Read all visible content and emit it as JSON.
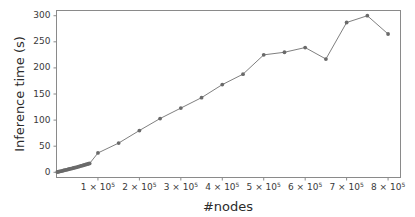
{
  "chart_data": {
    "type": "line",
    "title": "",
    "xlabel": "#nodes",
    "ylabel": "Inference time (s)",
    "xlim": [
      0,
      830000
    ],
    "ylim": [
      -10,
      310
    ],
    "grid": false,
    "legend": null,
    "marker": "circle",
    "line_color": "#707070",
    "marker_color": "#6a6a6a",
    "x_tick_values": [
      100000,
      200000,
      300000,
      400000,
      500000,
      600000,
      700000,
      800000
    ],
    "x_tick_labels": [
      "1 × 10⁵",
      "2 × 10⁵",
      "3 × 10⁵",
      "4 × 10⁵",
      "5 × 10⁵",
      "6 × 10⁵",
      "7 × 10⁵",
      "8 × 10⁵"
    ],
    "x_tick_mantissas": [
      "1",
      "2",
      "3",
      "4",
      "5",
      "6",
      "7",
      "8"
    ],
    "x_tick_exponent": "5",
    "x_tick_base": "10",
    "x_tick_times": "×",
    "y_tick_values": [
      0,
      50,
      100,
      150,
      200,
      250,
      300
    ],
    "y_tick_labels": [
      "0",
      "50",
      "100",
      "150",
      "200",
      "250",
      "300"
    ],
    "series": [
      {
        "name": "inference time",
        "x": [
          2000,
          5000,
          8000,
          11000,
          14000,
          17000,
          20000,
          23000,
          26000,
          29000,
          32000,
          35000,
          38000,
          41000,
          44000,
          47000,
          50000,
          53000,
          56000,
          59000,
          62000,
          65000,
          68000,
          71000,
          74000,
          77000,
          80000,
          100000,
          150000,
          200000,
          250000,
          300000,
          350000,
          400000,
          450000,
          500000,
          550000,
          600000,
          650000,
          700000,
          750000,
          800000
        ],
        "y": [
          0.5,
          1.0,
          1.6,
          2.2,
          2.8,
          3.4,
          4.0,
          4.6,
          5.2,
          5.8,
          6.4,
          7.0,
          7.6,
          8.2,
          8.8,
          9.4,
          10.0,
          10.7,
          11.4,
          12.1,
          12.8,
          13.5,
          14.2,
          14.9,
          15.6,
          16.3,
          17.0,
          37,
          56,
          80,
          103,
          123,
          143,
          168,
          188,
          225,
          230,
          239,
          217,
          287,
          300,
          265
        ]
      }
    ]
  }
}
